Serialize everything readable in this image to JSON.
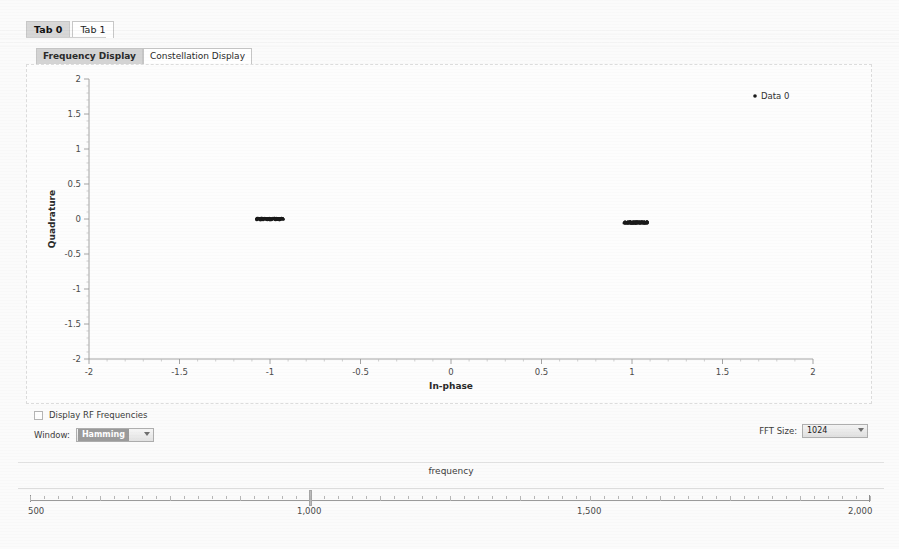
{
  "window_tabs": [
    {
      "label": "Tab 0",
      "active": true
    },
    {
      "label": "Tab 1",
      "active": false
    }
  ],
  "display_tabs": [
    {
      "label": "Frequency Display",
      "active": true
    },
    {
      "label": "Constellation Display",
      "active": false
    }
  ],
  "controls": {
    "rf_checkbox_label": "Display RF Frequencies",
    "rf_checked": false,
    "window_label": "Window:",
    "window_value": "Hamming",
    "fft_label": "FFT Size:",
    "fft_value": "1024"
  },
  "freq_slider": {
    "label": "frequency",
    "min": 500,
    "max": 2000,
    "value": 1000,
    "tick_labels": [
      "500",
      "1,000",
      "1,500",
      "2,000"
    ],
    "tick_values": [
      500,
      1000,
      1500,
      2000
    ]
  },
  "colors": {
    "marker": "#1a1a1a",
    "axis": "#9a9a9a",
    "plot_bg": "#fdfdfd",
    "tab_active": "#d4d4d4"
  },
  "chart_data": {
    "type": "scatter",
    "title": "",
    "xlabel": "In-phase",
    "ylabel": "Quadrature",
    "xlim": [
      -2,
      2
    ],
    "ylim": [
      -2,
      2
    ],
    "xticks": [
      -2,
      -1.5,
      -1,
      -0.5,
      0,
      0.5,
      1,
      1.5,
      2
    ],
    "xtick_labels": [
      "-2",
      "-1.5",
      "-1",
      "-0.5",
      "0",
      "0.5",
      "1",
      "1.5",
      "2"
    ],
    "yticks": [
      -2,
      -1.5,
      -1,
      -0.5,
      0,
      0.5,
      1,
      1.5,
      2
    ],
    "ytick_labels": [
      "-2",
      "-1.5",
      "-1",
      "-0.5",
      "0",
      "0.5",
      "1",
      "1.5",
      "2"
    ],
    "grid": false,
    "legend_position": "top-right",
    "legend": [
      "Data 0"
    ],
    "series": [
      {
        "name": "Data 0",
        "color": "#1a1a1a",
        "marker": "dot",
        "clusters": [
          {
            "center_x": -1.0,
            "center_y": 0.0,
            "spread_x": 0.075,
            "spread_y": 0.012,
            "n": 120
          },
          {
            "center_x": 1.02,
            "center_y": -0.05,
            "spread_x": 0.065,
            "spread_y": 0.012,
            "n": 120
          }
        ]
      }
    ]
  }
}
